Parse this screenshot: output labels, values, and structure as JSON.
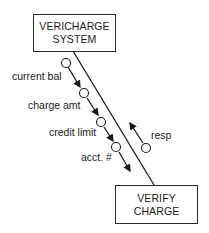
{
  "diagram": {
    "type": "structure-chart-connection",
    "modules": [
      {
        "id": "top",
        "lines": [
          "VERICHARGE",
          "SYSTEM"
        ]
      },
      {
        "id": "bottom",
        "lines": [
          "VERIFY",
          "CHARGE"
        ]
      }
    ],
    "downward_couples": [
      {
        "label": "current bal"
      },
      {
        "label": "charge amt"
      },
      {
        "label": "credit limit"
      },
      {
        "label": "acct. #"
      }
    ],
    "upward_couples": [
      {
        "label": "resp"
      }
    ]
  }
}
